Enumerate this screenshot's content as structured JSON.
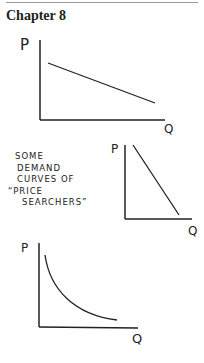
{
  "header": {
    "chapter": "Chapter 8"
  },
  "caption": {
    "lines": [
      "Some",
      "Demand",
      "curves of",
      "“Price",
      "Searchers”"
    ]
  },
  "graphs": [
    {
      "shape": "shallow-linear",
      "y_label": "P",
      "x_label": "Q"
    },
    {
      "shape": "steep-linear",
      "y_label": "P",
      "x_label": "Q"
    },
    {
      "shape": "convex-curve",
      "y_label": "P",
      "x_label": "Q"
    }
  ]
}
